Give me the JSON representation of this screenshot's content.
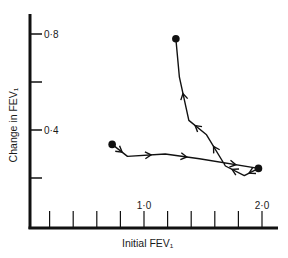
{
  "chart_data": {
    "type": "line",
    "title": "",
    "xlabel": "Initial FEV₁",
    "ylabel": "Change in FEV₁",
    "xlim": [
      0.0,
      2.1
    ],
    "ylim": [
      0.0,
      0.9
    ],
    "x_ticks": [
      0.2,
      0.4,
      0.6,
      0.8,
      1.0,
      1.2,
      1.4,
      1.6,
      1.8,
      2.0
    ],
    "x_tick_labels": {
      "1.0": "1·0",
      "2.0": "2·0"
    },
    "y_ticks": [
      0.2,
      0.4,
      0.6,
      0.8
    ],
    "y_tick_labels": {
      "0.4": "0·4",
      "0.8": "0·8"
    },
    "grid": false,
    "legend": null,
    "series": [
      {
        "name": "trajectory",
        "start_marker": true,
        "end_marker": true,
        "points": [
          {
            "x": 0.73,
            "y": 0.34
          },
          {
            "x": 0.86,
            "y": 0.29
          },
          {
            "x": 1.18,
            "y": 0.3
          },
          {
            "x": 1.47,
            "y": 0.28
          },
          {
            "x": 1.97,
            "y": 0.24
          },
          {
            "x": 1.85,
            "y": 0.21
          },
          {
            "x": 1.69,
            "y": 0.25
          },
          {
            "x": 1.53,
            "y": 0.38
          },
          {
            "x": 1.38,
            "y": 0.44
          },
          {
            "x": 1.3,
            "y": 0.62
          },
          {
            "x": 1.27,
            "y": 0.78
          }
        ],
        "arrows_at_segments": [
          0,
          1,
          2,
          3,
          4,
          5,
          6,
          7,
          8
        ]
      }
    ],
    "markers": [
      {
        "x": 0.73,
        "y": 0.34
      },
      {
        "x": 1.97,
        "y": 0.24
      },
      {
        "x": 1.27,
        "y": 0.78
      }
    ]
  }
}
